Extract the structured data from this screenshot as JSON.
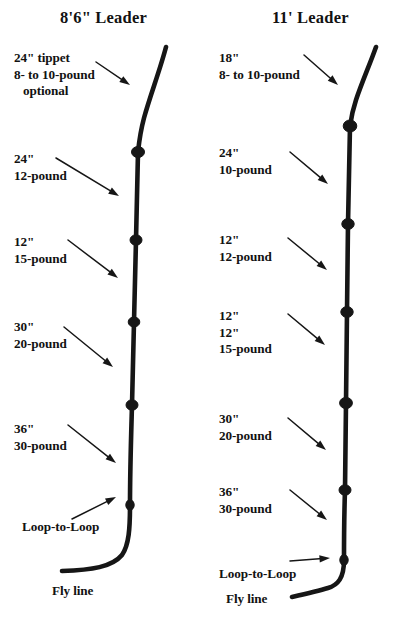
{
  "document": {
    "kind": "fly-fishing-leader-formula-diagram",
    "background_color": "#ffffff",
    "ink_color": "#161616"
  },
  "diagrams": [
    {
      "id": "leader-8ft6",
      "title": "8'6\" Leader",
      "title_position": {
        "x": 60,
        "y": 8
      },
      "line_path": "M 166,47 C 160,70 150,96 144,118 C 140,133 139,143 138,152 L 136,240 L 134,322 L 132,405 C 131,440 130,470 130,505 C 130,528 129,545 122,555 C 112,567 92,570 62,571",
      "knots": [
        {
          "name": "blood-knot",
          "cx": 138,
          "cy": 152,
          "rx": 6.5,
          "ry": 5.5
        },
        {
          "name": "blood-knot",
          "cx": 136,
          "cy": 240,
          "rx": 6.0,
          "ry": 5.2
        },
        {
          "name": "blood-knot",
          "cx": 134,
          "cy": 322,
          "rx": 5.8,
          "ry": 5.0
        },
        {
          "name": "blood-knot",
          "cx": 132,
          "cy": 405,
          "rx": 6.0,
          "ry": 5.2
        },
        {
          "name": "loop-to-loop-knot",
          "cx": 130,
          "cy": 505,
          "rx": 4.2,
          "ry": 5.2
        }
      ],
      "labels": [
        {
          "name": "tippet-label",
          "lines": [
            "24\" tippet",
            "8- to 10-pound",
            "optional"
          ],
          "indent_lines": [
            false,
            false,
            true
          ],
          "x": 14,
          "y": 50,
          "arrow": {
            "x1": 96,
            "y1": 62,
            "x2": 130,
            "y2": 85
          }
        },
        {
          "name": "segment-24-12-label",
          "lines": [
            "24\"",
            "12-pound"
          ],
          "indent_lines": [
            false,
            false
          ],
          "x": 14,
          "y": 151,
          "arrow": {
            "x1": 56,
            "y1": 158,
            "x2": 119,
            "y2": 196
          }
        },
        {
          "name": "segment-12-15-label",
          "lines": [
            "12\"",
            "15-pound"
          ],
          "indent_lines": [
            false,
            false
          ],
          "x": 14,
          "y": 234,
          "arrow": {
            "x1": 68,
            "y1": 240,
            "x2": 118,
            "y2": 278
          }
        },
        {
          "name": "segment-30-20-label",
          "lines": [
            "30\"",
            "20-pound"
          ],
          "indent_lines": [
            false,
            false
          ],
          "x": 14,
          "y": 319,
          "arrow": {
            "x1": 64,
            "y1": 327,
            "x2": 113,
            "y2": 367
          }
        },
        {
          "name": "segment-36-30-label",
          "lines": [
            "36\"",
            "30-pound"
          ],
          "indent_lines": [
            false,
            false
          ],
          "x": 14,
          "y": 421,
          "arrow": {
            "x1": 68,
            "y1": 425,
            "x2": 116,
            "y2": 463
          }
        },
        {
          "name": "loop-to-loop-label",
          "lines": [
            "Loop-to-Loop"
          ],
          "indent_lines": [
            false
          ],
          "x": 22,
          "y": 519,
          "arrow": {
            "x1": 72,
            "y1": 519,
            "x2": 116,
            "y2": 497
          }
        },
        {
          "name": "fly-line-label",
          "lines": [
            "Fly line"
          ],
          "indent_lines": [
            false
          ],
          "x": 52,
          "y": 583,
          "arrow": null
        }
      ]
    },
    {
      "id": "leader-11ft",
      "title": "11' Leader",
      "title_position": {
        "x": 272,
        "y": 8
      },
      "line_path": "M 376,47 C 370,64 362,82 356,100 C 352,112 351,119 350,126 L 348,224 L 347,312 L 346,403 L 345,490 C 344,520 344,540 344,560 C 344,578 338,585 328,588 C 318,591 305,594 292,597",
      "knots": [
        {
          "name": "blood-knot",
          "cx": 350,
          "cy": 126,
          "rx": 6.8,
          "ry": 6.0
        },
        {
          "name": "blood-knot",
          "cx": 348,
          "cy": 224,
          "rx": 6.2,
          "ry": 5.4
        },
        {
          "name": "blood-knot",
          "cx": 347,
          "cy": 312,
          "rx": 6.2,
          "ry": 5.4
        },
        {
          "name": "blood-knot",
          "cx": 346,
          "cy": 403,
          "rx": 6.4,
          "ry": 5.6
        },
        {
          "name": "blood-knot",
          "cx": 345,
          "cy": 490,
          "rx": 6.0,
          "ry": 5.2
        },
        {
          "name": "loop-to-loop-knot",
          "cx": 344,
          "cy": 560,
          "rx": 4.2,
          "ry": 5.4
        }
      ],
      "labels": [
        {
          "name": "tippet-label",
          "lines": [
            "18\"",
            "8- to 10-pound"
          ],
          "indent_lines": [
            false,
            false
          ],
          "x": 219,
          "y": 50,
          "arrow": {
            "x1": 304,
            "y1": 55,
            "x2": 338,
            "y2": 85
          }
        },
        {
          "name": "segment-24-10-label",
          "lines": [
            "24\"",
            "10-pound"
          ],
          "indent_lines": [
            false,
            false
          ],
          "x": 219,
          "y": 145,
          "arrow": {
            "x1": 290,
            "y1": 152,
            "x2": 328,
            "y2": 184
          }
        },
        {
          "name": "segment-12-12-label",
          "lines": [
            "12\"",
            "12-pound"
          ],
          "indent_lines": [
            false,
            false
          ],
          "x": 219,
          "y": 232,
          "arrow": {
            "x1": 288,
            "y1": 238,
            "x2": 327,
            "y2": 270
          }
        },
        {
          "name": "segment-12-15-label",
          "lines": [
            "12\"",
            "12\"",
            "15-pound"
          ],
          "indent_lines": [
            false,
            false,
            false
          ],
          "x": 219,
          "y": 308,
          "arrow": {
            "x1": 288,
            "y1": 314,
            "x2": 325,
            "y2": 345
          }
        },
        {
          "name": "segment-30-20-label",
          "lines": [
            "30\"",
            "20-pound"
          ],
          "indent_lines": [
            false,
            false
          ],
          "x": 219,
          "y": 411,
          "arrow": {
            "x1": 288,
            "y1": 418,
            "x2": 326,
            "y2": 450
          }
        },
        {
          "name": "segment-36-30-label",
          "lines": [
            "36\"",
            "30-pound"
          ],
          "indent_lines": [
            false,
            false
          ],
          "x": 219,
          "y": 484,
          "arrow": {
            "x1": 290,
            "y1": 490,
            "x2": 327,
            "y2": 520
          }
        },
        {
          "name": "loop-to-loop-label",
          "lines": [
            "Loop-to-Loop"
          ],
          "indent_lines": [
            false
          ],
          "x": 219,
          "y": 566,
          "arrow": {
            "x1": 290,
            "y1": 561,
            "x2": 330,
            "y2": 558
          }
        },
        {
          "name": "fly-line-label",
          "lines": [
            "Fly line"
          ],
          "indent_lines": [
            false
          ],
          "x": 226,
          "y": 591,
          "arrow": null
        }
      ]
    }
  ],
  "label_overrides": {
    "left_12_15_fix": [
      "12\"",
      "15-pound"
    ]
  }
}
